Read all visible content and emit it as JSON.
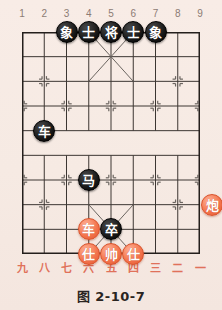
{
  "figure": {
    "caption": "图 2-10-7",
    "background_color": "#f7ece6"
  },
  "board": {
    "columns": 9,
    "rows": 10,
    "file_labels_top": [
      "1",
      "2",
      "3",
      "4",
      "5",
      "6",
      "7",
      "8",
      "9"
    ],
    "file_labels_bottom": [
      "九",
      "八",
      "七",
      "六",
      "五",
      "四",
      "三",
      "二",
      "一"
    ],
    "line_color": "#3c3632",
    "border_color": "#241f1c",
    "river_label": "",
    "star_points": [
      {
        "col": 2,
        "row": 2
      },
      {
        "col": 8,
        "row": 2
      },
      {
        "col": 1,
        "row": 3
      },
      {
        "col": 3,
        "row": 3
      },
      {
        "col": 5,
        "row": 3
      },
      {
        "col": 7,
        "row": 3
      },
      {
        "col": 9,
        "row": 3
      },
      {
        "col": 2,
        "row": 7
      },
      {
        "col": 8,
        "row": 7
      },
      {
        "col": 1,
        "row": 6
      },
      {
        "col": 3,
        "row": 6
      },
      {
        "col": 5,
        "row": 6
      },
      {
        "col": 7,
        "row": 6
      },
      {
        "col": 9,
        "row": 6
      }
    ]
  },
  "pieces": [
    {
      "label": "象",
      "side": "black",
      "col": 3,
      "row": 0,
      "name": "piece-black-elephant-left"
    },
    {
      "label": "士",
      "side": "black",
      "col": 4,
      "row": 0,
      "name": "piece-black-advisor-left"
    },
    {
      "label": "将",
      "side": "black",
      "col": 5,
      "row": 0,
      "name": "piece-black-general"
    },
    {
      "label": "士",
      "side": "black",
      "col": 6,
      "row": 0,
      "name": "piece-black-advisor-right"
    },
    {
      "label": "象",
      "side": "black",
      "col": 7,
      "row": 0,
      "name": "piece-black-elephant-right"
    },
    {
      "label": "车",
      "side": "black",
      "col": 2,
      "row": 4,
      "name": "piece-black-chariot"
    },
    {
      "label": "马",
      "side": "black",
      "col": 4,
      "row": 6,
      "name": "piece-black-horse"
    },
    {
      "label": "卒",
      "side": "black",
      "col": 5,
      "row": 8,
      "name": "piece-black-pawn"
    },
    {
      "label": "炮",
      "side": "red",
      "col": 9.55,
      "row": 7,
      "name": "piece-red-cannon"
    },
    {
      "label": "车",
      "side": "red",
      "col": 4,
      "row": 8,
      "name": "piece-red-chariot"
    },
    {
      "label": "仕",
      "side": "red",
      "col": 4,
      "row": 9,
      "name": "piece-red-advisor-left"
    },
    {
      "label": "帅",
      "side": "red",
      "col": 5,
      "row": 9,
      "name": "piece-red-general"
    },
    {
      "label": "仕",
      "side": "red",
      "col": 6,
      "row": 9,
      "name": "piece-red-advisor-right"
    }
  ]
}
